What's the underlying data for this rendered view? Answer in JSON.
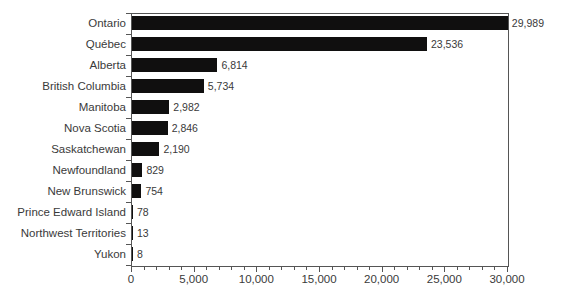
{
  "chart_data": {
    "type": "bar",
    "orientation": "horizontal",
    "title": "",
    "subtitle": "",
    "xlabel": "",
    "ylabel": "",
    "xlim": [
      0,
      30000
    ],
    "grid": false,
    "legend": null,
    "bar_color": "#100f0f",
    "axis_color": "#555555",
    "text_color": "#3a3a3a",
    "x_major_ticks": [
      0,
      5000,
      10000,
      15000,
      20000,
      25000,
      30000
    ],
    "x_major_tick_labels": [
      "0",
      "5,000",
      "10,000",
      "15,000",
      "20,000",
      "25,000",
      "30,000"
    ],
    "x_minor_tick_interval": 1000,
    "categories": [
      "Ontario",
      "Québec",
      "Alberta",
      "British Columbia",
      "Manitoba",
      "Nova Scotia",
      "Saskatchewan",
      "Newfoundland",
      "New Brunswick",
      "Prince Edward Island",
      "Northwest Territories",
      "Yukon"
    ],
    "values": [
      29989,
      23536,
      6814,
      5734,
      2982,
      2846,
      2190,
      829,
      754,
      78,
      13,
      8
    ],
    "value_labels": [
      "29,989",
      "23,536",
      "6,814",
      "5,734",
      "2,982",
      "2,846",
      "2,190",
      "829",
      "754",
      "78",
      "13",
      "8"
    ]
  }
}
